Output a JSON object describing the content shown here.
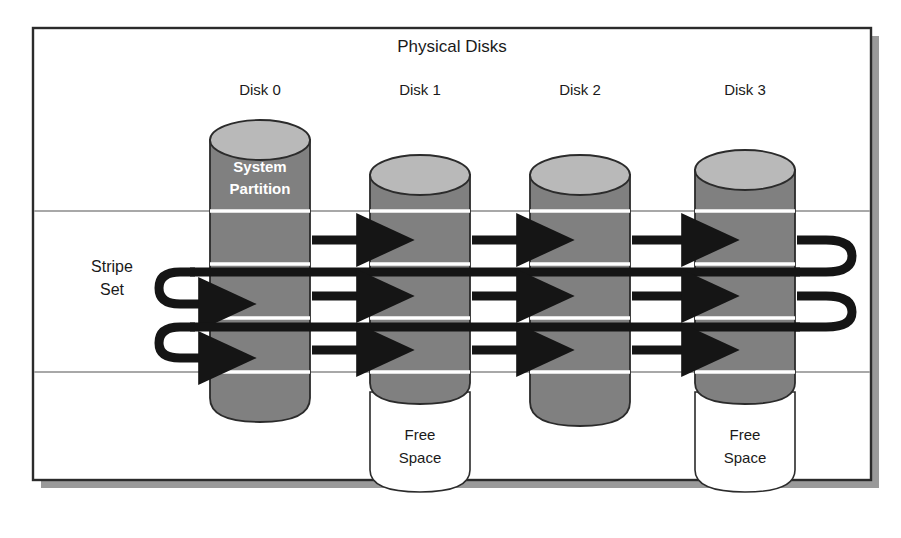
{
  "figure": {
    "title": "Physical Disks",
    "left_label_line1": "Stripe",
    "left_label_line2": "Set",
    "partition_label_line1": "System",
    "partition_label_line2": "Partition",
    "free_label_line1": "Free",
    "free_label_line2": "Space"
  },
  "disks": [
    {
      "label": "Disk 0",
      "cx": 260,
      "has_free_space": false,
      "has_system_partition": true,
      "body_top": 140,
      "body_bottom": 420
    },
    {
      "label": "Disk 1",
      "cx": 420,
      "has_free_space": true,
      "has_system_partition": false,
      "body_top": 175,
      "body_bottom": 400
    },
    {
      "label": "Disk 2",
      "cx": 580,
      "has_free_space": false,
      "has_system_partition": false,
      "body_top": 175,
      "body_bottom": 425
    },
    {
      "label": "Disk 3",
      "cx": 745,
      "has_free_space": true,
      "has_system_partition": false,
      "body_top": 170,
      "body_bottom": 400
    }
  ],
  "geometry": {
    "frame": {
      "x": 33,
      "y": 28,
      "w": 838,
      "h": 452
    },
    "disk_half_width": 50,
    "ellipse_ry": 20,
    "band_lines_y": [
      211,
      372
    ],
    "stripe_rows_y": [
      240,
      296,
      350
    ],
    "return_bars_y": [
      272,
      327
    ],
    "free_space_bottom": 492
  },
  "colors": {
    "body_gray": "#808080",
    "top_gray": "#b9b9b9",
    "outline": "#2b2b2b",
    "band_line": "#a8a8a8",
    "arrow": "#151515",
    "divider": "#ffffff",
    "frame_border": "#2b2b2b",
    "shadow": "#9a9a9a",
    "background": "#ffffff"
  }
}
